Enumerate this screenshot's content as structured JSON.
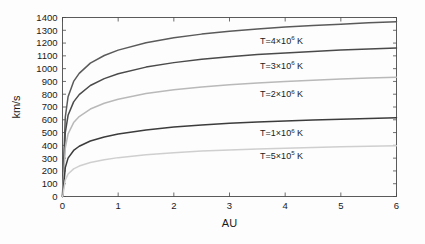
{
  "chart_data": {
    "type": "line",
    "title": "",
    "xlabel": "AU",
    "ylabel": "km/s",
    "xlim": [
      0,
      6
    ],
    "ylim": [
      0,
      1400
    ],
    "grid": false,
    "legend_position": "inline-right",
    "xticks": [
      "0",
      "1",
      "2",
      "3",
      "4",
      "5",
      "6"
    ],
    "yticks": [
      "0",
      "100",
      "200",
      "300",
      "400",
      "500",
      "600",
      "700",
      "800",
      "900",
      "1000",
      "1100",
      "1200",
      "1300",
      "1400"
    ],
    "x": [
      0.01,
      0.05,
      0.1,
      0.2,
      0.3,
      0.5,
      0.75,
      1,
      1.5,
      2,
      2.5,
      3,
      3.5,
      4,
      4.5,
      5,
      5.5,
      6
    ],
    "series": [
      {
        "name": "T=4×10⁶ K",
        "label_plain": "T=4x10^6 K",
        "label_prefix": "T=4×10",
        "label_exponent": "6",
        "label_suffix": " K",
        "color": "#5a5a5a",
        "width": 1.5,
        "label_x": 3.55,
        "label_y": 1218,
        "values": [
          130,
          620,
          780,
          900,
          963,
          1043,
          1103,
          1145,
          1203,
          1242,
          1270,
          1293,
          1310,
          1325,
          1337,
          1348,
          1358,
          1366
        ]
      },
      {
        "name": "T=3×10⁶ K",
        "label_plain": "T=3x10^6 K",
        "label_prefix": "T=3×10",
        "label_exponent": "6",
        "label_suffix": " K",
        "color": "#4a4a4a",
        "width": 1.5,
        "label_x": 3.55,
        "label_y": 1022,
        "values": [
          95,
          500,
          635,
          740,
          797,
          868,
          922,
          960,
          1012,
          1047,
          1073,
          1093,
          1110,
          1123,
          1135,
          1145,
          1154,
          1162
        ]
      },
      {
        "name": "T=2×10⁶ K",
        "label_plain": "T=2x10^6 K",
        "label_prefix": "T=2×10",
        "label_exponent": "6",
        "label_suffix": " K",
        "color": "#b9b9b9",
        "width": 1.5,
        "label_x": 3.55,
        "label_y": 800,
        "values": [
          70,
          378,
          490,
          578,
          625,
          684,
          729,
          761,
          805,
          835,
          857,
          874,
          888,
          900,
          910,
          919,
          926,
          933
        ]
      },
      {
        "name": "T=1×10⁶ K",
        "label_plain": "T=1x10^6 K",
        "label_prefix": "T=1×10",
        "label_exponent": "6",
        "label_suffix": " K",
        "color": "#3c3c3c",
        "width": 1.5,
        "label_x": 3.55,
        "label_y": 497,
        "values": [
          35,
          226,
          300,
          360,
          393,
          434,
          466,
          489,
          521,
          543,
          559,
          572,
          582,
          591,
          598,
          605,
          611,
          616
        ]
      },
      {
        "name": "T=5×10⁵ K",
        "label_plain": "T=5x10^5 K",
        "label_prefix": "T=5×10",
        "label_exponent": "5",
        "label_suffix": " K",
        "color": "#cfcfcf",
        "width": 1.5,
        "label_x": 3.55,
        "label_y": 318,
        "values": [
          18,
          128,
          176,
          216,
          238,
          266,
          288,
          304,
          327,
          343,
          355,
          364,
          372,
          378,
          384,
          389,
          393,
          397
        ]
      }
    ]
  },
  "axes": {
    "x_title": "AU",
    "y_title": "km/s"
  }
}
